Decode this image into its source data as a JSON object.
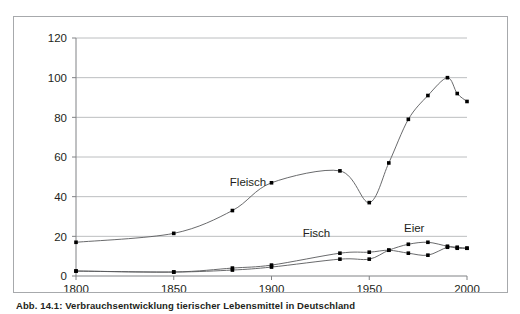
{
  "figure": {
    "caption": "Abb. 14.1: Verbrauchsentwicklung tierischer Lebensmittel in Deutschland"
  },
  "colors": {
    "frame": "#a7a9ac",
    "gridline": "#bcbec0",
    "axis": "#808285",
    "line": "#58595b",
    "marker": "#000000",
    "text": "#231f20",
    "background": "#ffffff"
  },
  "chart_data": {
    "type": "line",
    "title": "",
    "subtitle": "",
    "xlabel": "",
    "ylabel": "",
    "xlim": [
      1800,
      2000
    ],
    "ylim": [
      0,
      120
    ],
    "xticks": [
      1800,
      1850,
      1900,
      1950,
      2000
    ],
    "xtick_labels": [
      "1800",
      "1850",
      "1900",
      "1950",
      "2000"
    ],
    "yticks": [
      0,
      20,
      40,
      60,
      80,
      100,
      120
    ],
    "ytick_labels": [
      "0",
      "20",
      "40",
      "60",
      "80",
      "100",
      "120"
    ],
    "grid": "horizontal",
    "legend_position": "inline-annotations",
    "markers": "square",
    "series": [
      {
        "name": "Fleisch",
        "label_x": 1888,
        "label_y": 45.5,
        "x": [
          1800,
          1850,
          1880,
          1900,
          1935,
          1950,
          1960,
          1970,
          1980,
          1990,
          1995,
          2000
        ],
        "y": [
          17,
          21.5,
          33,
          47,
          53,
          37,
          57,
          79,
          91,
          100,
          92,
          88
        ]
      },
      {
        "name": "Fisch",
        "label_x": 1923,
        "label_y": 19.5,
        "x": [
          1800,
          1850,
          1880,
          1900,
          1935,
          1950,
          1960,
          1970,
          1980,
          1990,
          1995,
          2000
        ],
        "y": [
          2.5,
          2,
          4,
          5.5,
          11.5,
          12,
          13,
          11.5,
          10.5,
          14.5,
          14,
          14
        ]
      },
      {
        "name": "Eier",
        "label_x": 1973,
        "label_y": 22,
        "x": [
          1800,
          1850,
          1880,
          1900,
          1935,
          1950,
          1960,
          1970,
          1980,
          1990,
          1995,
          2000
        ],
        "y": [
          2.5,
          2,
          3,
          4.5,
          8.5,
          8.5,
          13,
          16,
          17,
          15,
          14.5,
          14
        ]
      }
    ]
  }
}
